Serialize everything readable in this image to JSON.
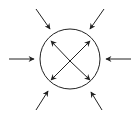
{
  "diagram": {
    "colors": {
      "stroke": "#222222",
      "background": "#ffffff"
    },
    "circle": {
      "cx": 70,
      "cy": 59,
      "r": 30
    },
    "external_arrows": [
      {
        "name": "top-left",
        "x1": 36,
        "y1": 9,
        "x2": 50,
        "y2": 29
      },
      {
        "name": "top-right",
        "x1": 104,
        "y1": 9,
        "x2": 90,
        "y2": 29
      },
      {
        "name": "left",
        "x1": 9,
        "y1": 59,
        "x2": 34,
        "y2": 59
      },
      {
        "name": "right",
        "x1": 131,
        "y1": 59,
        "x2": 106,
        "y2": 59
      },
      {
        "name": "bottom-left",
        "x1": 36,
        "y1": 110,
        "x2": 48,
        "y2": 91
      },
      {
        "name": "bottom-right",
        "x1": 102,
        "y1": 110,
        "x2": 91,
        "y2": 92
      }
    ],
    "internal_arrows": [
      {
        "name": "up-left",
        "x1": 70,
        "y1": 61,
        "x2": 51,
        "y2": 41
      },
      {
        "name": "up-right",
        "x1": 70,
        "y1": 61,
        "x2": 90,
        "y2": 41
      },
      {
        "name": "down-left",
        "x1": 70,
        "y1": 61,
        "x2": 51,
        "y2": 80
      },
      {
        "name": "down-right",
        "x1": 70,
        "y1": 61,
        "x2": 90,
        "y2": 80
      }
    ]
  }
}
